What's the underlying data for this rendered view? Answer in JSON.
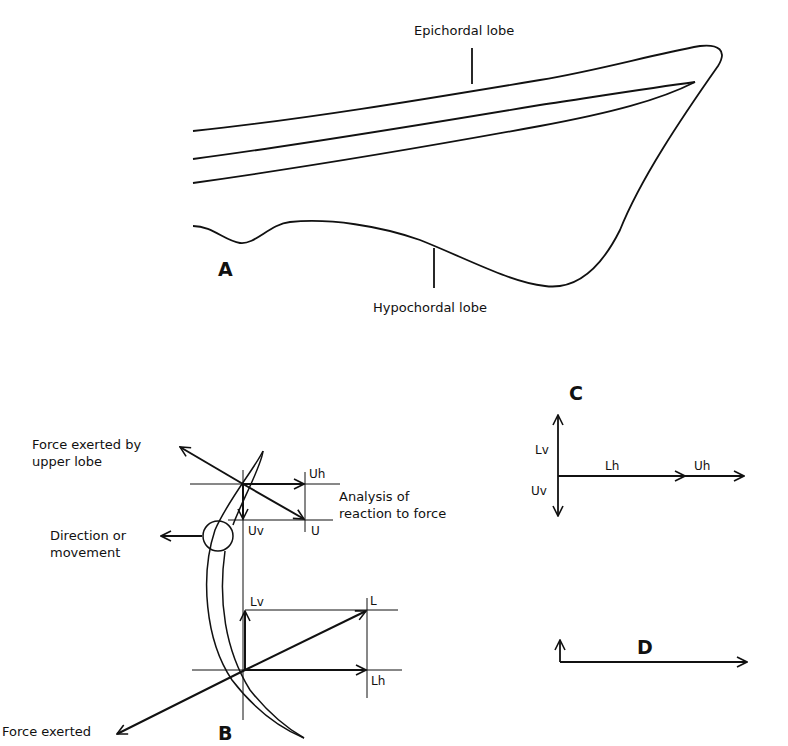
{
  "figure_a": {
    "panel_label": "A",
    "labels": {
      "epichordal": "Epichordal lobe",
      "hypochordal": "Hypochordal lobe"
    }
  },
  "figure_b": {
    "panel_label": "B",
    "labels": {
      "upper_force_line1": "Force exerted by",
      "upper_force_line2": "upper lobe",
      "direction_line1": "Direction or",
      "direction_line2": "movement",
      "analysis_line1": "Analysis of",
      "analysis_line2": "reaction to force",
      "lower_force": "Force exerted"
    },
    "vector_labels": {
      "Uh": "Uh",
      "U": "U",
      "Uv": "Uv",
      "Lv": "Lv",
      "L": "L",
      "Lh": "Lh"
    }
  },
  "figure_c": {
    "panel_label": "C",
    "vector_labels": {
      "Lv": "Lv",
      "Uv": "Uv",
      "Lh": "Lh",
      "Uh": "Uh"
    }
  },
  "figure_d": {
    "panel_label": "D"
  },
  "colors": {
    "ink": "#111111",
    "background": "#ffffff"
  }
}
